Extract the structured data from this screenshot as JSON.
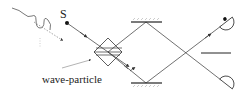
{
  "diagram": {
    "source_label": "S",
    "beam_splitter_label": "wave-particle",
    "colors": {
      "stroke": "#333333",
      "text": "#222222",
      "background": "#ffffff"
    },
    "components": [
      {
        "id": "photon-input",
        "kind": "wavy-photon"
      },
      {
        "id": "source",
        "kind": "point-source",
        "label": "S"
      },
      {
        "id": "beam-splitter",
        "kind": "wave-particle-beam-splitter"
      },
      {
        "id": "mirror-top",
        "kind": "mirror"
      },
      {
        "id": "mirror-bottom",
        "kind": "mirror"
      },
      {
        "id": "detector-top",
        "kind": "detector",
        "state": "clicked"
      },
      {
        "id": "detector-bottom",
        "kind": "detector",
        "state": "idle"
      },
      {
        "id": "output-plate",
        "kind": "line-element"
      }
    ]
  }
}
